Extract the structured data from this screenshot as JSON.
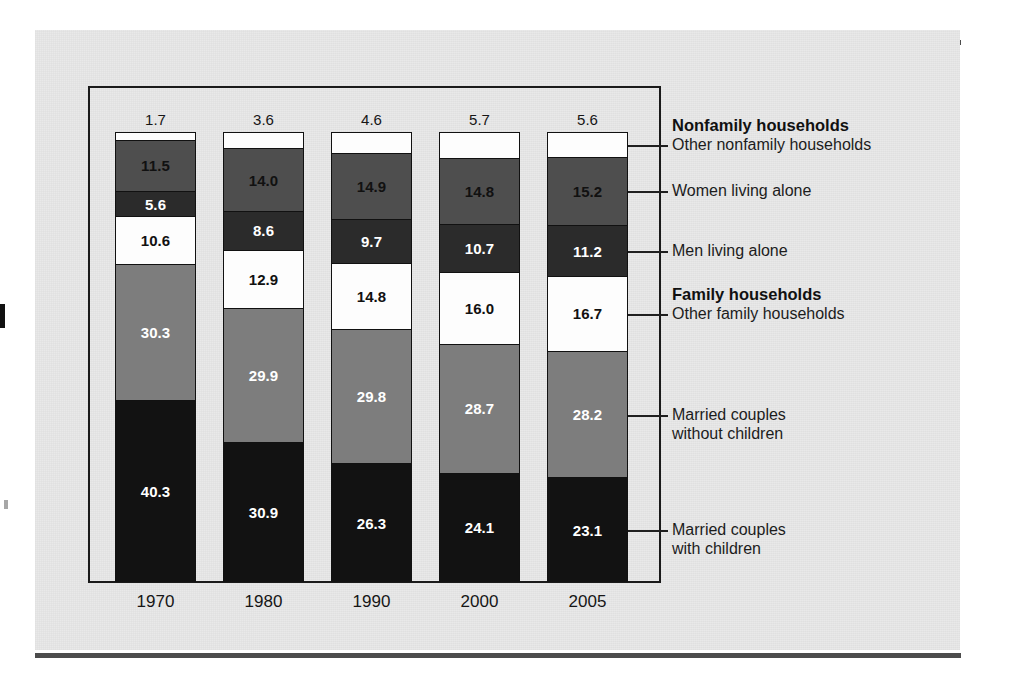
{
  "figure": {
    "background_color": "#e9e9e9",
    "frame_color": "#1a1a1a"
  },
  "axis": {
    "year_labels": [
      "1970",
      "1980",
      "1990",
      "2000",
      "2005"
    ]
  },
  "legend": {
    "group_nonfamily_label": "Nonfamily households",
    "group_family_label": "Family households",
    "items": [
      {
        "label": "Other nonfamily households"
      },
      {
        "label": "Women living alone"
      },
      {
        "label": "Men living alone"
      },
      {
        "label": "Other family households"
      },
      {
        "label_line1": "Married couples",
        "label_line2": "without children"
      },
      {
        "label_line1": "Married couples",
        "label_line2": "with children"
      }
    ]
  },
  "chart_data": {
    "type": "bar",
    "subtype": "stacked-100-percent",
    "title": "",
    "xlabel": "",
    "ylabel": "",
    "ylim": [
      0,
      100
    ],
    "grid": false,
    "legend_position": "right",
    "categories": [
      "1970",
      "1980",
      "1990",
      "2000",
      "2005"
    ],
    "series": [
      {
        "name": "Married couples with children",
        "group": "Family households",
        "color": "#121212",
        "text_color": "#ffffff",
        "label_inside": true,
        "values": [
          40.3,
          30.9,
          26.3,
          24.1,
          23.1
        ]
      },
      {
        "name": "Married couples without children",
        "group": "Family households",
        "color": "#7d7d7d",
        "text_color": "#ffffff",
        "label_inside": true,
        "values": [
          30.3,
          29.9,
          29.8,
          28.7,
          28.2
        ]
      },
      {
        "name": "Other family households",
        "group": "Family households",
        "color": "#fdfdfd",
        "text_color": "#111111",
        "label_inside": true,
        "values": [
          10.6,
          12.9,
          14.8,
          16.0,
          16.7
        ]
      },
      {
        "name": "Men living alone",
        "group": "Nonfamily households",
        "color": "#2b2b2b",
        "text_color": "#ffffff",
        "label_inside": true,
        "values": [
          5.6,
          8.6,
          9.7,
          10.7,
          11.2
        ]
      },
      {
        "name": "Women living alone",
        "group": "Nonfamily households",
        "color": "#4e4e4e",
        "text_color": "#111111",
        "label_inside": true,
        "values": [
          11.5,
          14.0,
          14.9,
          14.8,
          15.2
        ]
      },
      {
        "name": "Other nonfamily households",
        "group": "Nonfamily households",
        "color": "#fdfdfd",
        "text_color": "#161616",
        "label_inside": false,
        "values": [
          1.7,
          3.6,
          4.6,
          5.7,
          5.6
        ]
      }
    ]
  }
}
